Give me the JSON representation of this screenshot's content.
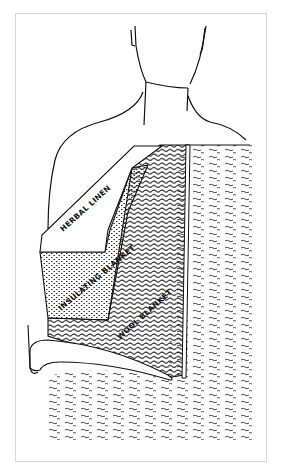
{
  "figure": {
    "labels": {
      "layer_1": "HERBAL LINEN",
      "layer_2": "INSULATING BLANKET",
      "layer_3": "WOOL BLANKET"
    },
    "colors": {
      "ink": "#111111",
      "background": "#ffffff",
      "frame": "#d8d8d8"
    }
  }
}
